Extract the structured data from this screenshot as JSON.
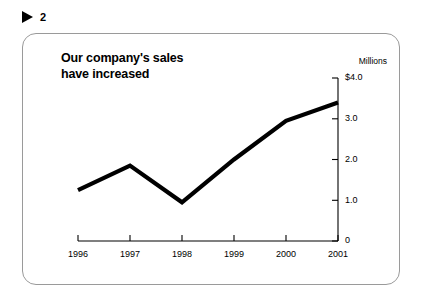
{
  "marker": {
    "icon": "play-triangle-icon",
    "number": "2"
  },
  "chart_data": {
    "type": "line",
    "title": "Our company's sales have increased",
    "title_line1": "Our company's sales",
    "title_line2": "have increased",
    "xlabel": "",
    "ylabel": "Millions",
    "unit_label": "Millions",
    "categories": [
      "1996",
      "1997",
      "1998",
      "1999",
      "2000",
      "2001"
    ],
    "values": [
      1.25,
      1.85,
      0.95,
      2.0,
      2.95,
      3.4
    ],
    "series": [
      {
        "name": "Sales",
        "values": [
          1.25,
          1.85,
          0.95,
          2.0,
          2.95,
          3.4
        ]
      }
    ],
    "ylim": [
      0,
      4.0
    ],
    "ytick_values": [
      0,
      1.0,
      2.0,
      3.0,
      4.0
    ],
    "ytick_labels": [
      "0",
      "1.0",
      "2.0",
      "3.0",
      "$4.0"
    ],
    "xtick_labels": [
      "1996",
      "1997",
      "1998",
      "1999",
      "2000",
      "2001"
    ],
    "grid": false,
    "legend": "none",
    "y_axis_position": "right",
    "line_color": "#000000",
    "line_width": 4.2
  },
  "colors": {
    "line": "#000000",
    "axis": "#000000",
    "card_border": "#9a9a9a",
    "background": "#ffffff",
    "text": "#000000"
  }
}
